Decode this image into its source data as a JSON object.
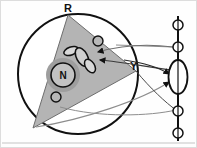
{
  "figure": {
    "background_color": "#fefefe",
    "frame_color": "#b8b8b8"
  },
  "labels": {
    "region_r": "R",
    "region_y": "Y",
    "nucleus": "N"
  },
  "colors": {
    "outline": "#111111",
    "wedge_fill": "#b4b4b4",
    "cell_fill": "#ffffff",
    "nucleus_halo_fill": "#9e9e9e",
    "nucleus_fill": "#c0c0c0",
    "vesicle_fill": "#d4d4d4",
    "ray_light": "#8d8d8d",
    "ray_dark": "#2a2a2a",
    "bead_fill": "#ffffff"
  },
  "cell": {
    "center_x": 78,
    "center_y": 74,
    "radius": 60,
    "wedge_vertices": [
      {
        "name": "apex-top-R",
        "x": 68,
        "y": 15
      },
      {
        "name": "apex-right-Y",
        "x": 136,
        "y": 71
      },
      {
        "name": "apex-bottom-left",
        "x": 33,
        "y": 128
      }
    ]
  },
  "nucleus": {
    "center_x": 63,
    "center_y": 75,
    "halo_radius": 17,
    "core_radius": 12
  },
  "vesicles": [
    {
      "name": "vesicle-upper-left",
      "cx": 71,
      "cy": 51,
      "rx": 7,
      "ry": 4,
      "rotate": -18
    },
    {
      "name": "vesicle-center",
      "cx": 82,
      "cy": 57,
      "rx": 9,
      "ry": 5,
      "rotate": 62
    },
    {
      "name": "vesicle-lower-right",
      "cx": 90,
      "cy": 64,
      "rx": 7,
      "ry": 4,
      "rotate": 58
    }
  ],
  "granules": [
    {
      "name": "granule-upper-right",
      "cx": 98,
      "cy": 41,
      "r": 5
    },
    {
      "name": "granule-lower-left",
      "cx": 56,
      "cy": 97,
      "r": 5
    }
  ],
  "rod": {
    "x": 178,
    "top_y": 18,
    "bottom_y": 140,
    "width": 2
  },
  "beads": [
    {
      "name": "bead-1",
      "cx": 178,
      "cy": 25,
      "r": 5
    },
    {
      "name": "bead-2",
      "cx": 178,
      "cy": 47,
      "r": 5
    },
    {
      "name": "bead-3",
      "cx": 178,
      "cy": 110,
      "r": 5
    },
    {
      "name": "bead-4",
      "cx": 178,
      "cy": 133,
      "r": 5
    }
  ],
  "target_ellipse": {
    "name": "target-ellipse",
    "cx": 178,
    "cy": 77,
    "rx": 9,
    "ry": 17
  },
  "rays": [
    {
      "name": "ray-top-incoming",
      "d": "M 118 45 L 173 47",
      "color": "#8d8d8d",
      "arrow": false
    },
    {
      "name": "ray-upper-to-vesicle",
      "d": "M 173 47 C 150 44 125 45 96 52",
      "color": "#8d8d8d",
      "arrow": true,
      "arrow_dir": "left"
    },
    {
      "name": "ray-lower-to-vesicle",
      "d": "M 172 72 C 148 68 122 62 100 61",
      "color": "#2a2a2a",
      "arrow": true,
      "arrow_dir": "left"
    },
    {
      "name": "ray-from-Y-to-ellipse",
      "d": "M 125 62 C 145 64 160 68 170 73",
      "color": "#2a2a2a",
      "arrow": true,
      "arrow_dir": "right"
    },
    {
      "name": "ray-lower-from-cell-to-ellipse",
      "d": "M 36 127 C 80 118 140 100 170 83",
      "color": "#8d8d8d",
      "arrow": true,
      "arrow_dir": "right"
    },
    {
      "name": "ray-bottom-bead-link",
      "d": "M 96 93 C 120 100 155 115 176 112",
      "color": "#8d8d8d",
      "arrow": false
    },
    {
      "name": "ray-y-to-bottom",
      "d": "M 136 71 C 150 90 165 105 176 112",
      "color": "#2a2a2a",
      "arrow": false
    }
  ]
}
